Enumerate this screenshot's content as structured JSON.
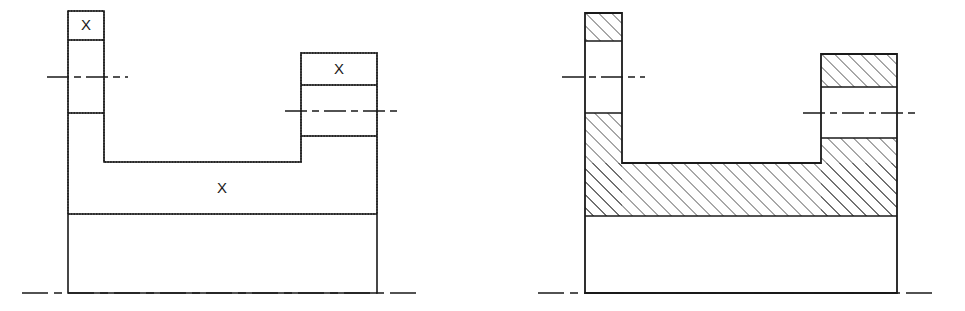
{
  "drawing": {
    "title": "Section view comparison: outline with marked regions vs. hatched section",
    "canvas": {
      "width": 965,
      "height": 311,
      "background": "#ffffff"
    },
    "line_color": "#1a1a1a",
    "hatch_color": "#1a1a1a",
    "labels": {
      "region_mark": "X"
    },
    "figures": [
      {
        "name": "left-figure",
        "style": "outline-with-x-marks",
        "geometry": {
          "body_left": 68,
          "body_right": 377,
          "left_stub_right": 104,
          "right_stub_left": 301,
          "left_stub_top": 11,
          "right_stub_top": 53,
          "left_stub_band_bottom": 40,
          "left_stub_divider": 113,
          "right_stub_band_bottom": 85,
          "right_stub_divider": 136,
          "channel_floor": 162,
          "body_divider": 214,
          "body_bottom": 293
        },
        "centerlines": [
          {
            "name": "left-stub-centerline",
            "y": 77,
            "x1": 47,
            "x2": 128
          },
          {
            "name": "right-stub-centerline",
            "y": 111,
            "x1": 285,
            "x2": 397
          },
          {
            "name": "base-centerline",
            "y": 293,
            "x1": 22,
            "x2": 420
          }
        ],
        "marks": [
          {
            "name": "mark-left-stub-top",
            "text": "X",
            "x": 86,
            "y": 26
          },
          {
            "name": "mark-right-stub-top",
            "text": "X",
            "x": 339,
            "y": 70
          },
          {
            "name": "mark-body-middle",
            "text": "X",
            "x": 222,
            "y": 189
          }
        ]
      },
      {
        "name": "right-figure",
        "style": "hatched-section",
        "geometry": {
          "body_left": 585,
          "body_right": 897,
          "left_stub_right": 622,
          "right_stub_left": 821,
          "left_stub_top": 13,
          "right_stub_top": 54,
          "left_stub_band_bottom": 41,
          "left_stub_divider": 113,
          "right_stub_band_bottom": 87,
          "right_stub_divider": 138,
          "channel_floor": 163,
          "body_divider": 216,
          "body_bottom": 293
        },
        "centerlines": [
          {
            "name": "left-stub-centerline",
            "y": 77,
            "x1": 562,
            "x2": 645
          },
          {
            "name": "right-stub-centerline",
            "y": 113,
            "x1": 803,
            "x2": 917
          },
          {
            "name": "base-centerline",
            "y": 293,
            "x1": 538,
            "x2": 937
          }
        ],
        "hatched_regions": [
          "left-stub-top-band",
          "left-stub-lower-leg",
          "right-stub-top-band",
          "right-stub-lower-leg",
          "main-body-slab"
        ],
        "hatch": {
          "angle_deg": 45,
          "spacing_px": 6.5,
          "stroke_width": 1.1
        }
      }
    ]
  }
}
